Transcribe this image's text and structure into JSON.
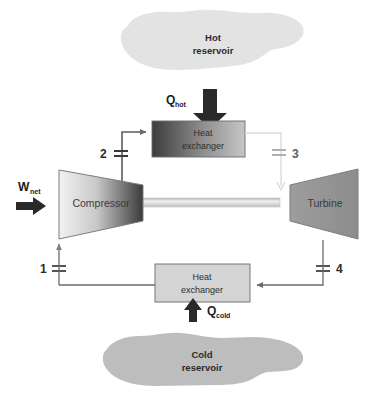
{
  "figure": {
    "background_color": "#ffffff"
  },
  "reservoirs": {
    "hot": {
      "line1": "Hot",
      "line2": "reservoir",
      "fill": "#e3e3e3",
      "name": "hot-reservoir"
    },
    "cold": {
      "line1": "Cold",
      "line2": "reservoir",
      "fill": "#bdbdbd",
      "name": "cold-reservoir"
    }
  },
  "components": {
    "compressor": {
      "label": "Compressor",
      "gradient_from": "#ededed",
      "gradient_to": "#3c3c3c",
      "stroke": "#6e6e6e"
    },
    "turbine": {
      "label": "Turbine",
      "gradient_from": "#9a9a9a",
      "gradient_to": "#8a8a8a",
      "stroke": "#7a7a7a"
    },
    "heat_exchanger_hot": {
      "line1": "Heat",
      "line2": "exchanger",
      "gradient_from": "#3f3f3f",
      "gradient_to": "#c2c2c2",
      "stroke": "#6a6a6a"
    },
    "heat_exchanger_cold": {
      "line1": "Heat",
      "line2": "exchanger",
      "fill": "#d4d4d4",
      "stroke": "#6a6a6a"
    },
    "shaft": {
      "name": "drive-shaft",
      "fill": "#d8d8d8"
    }
  },
  "heat_flows": {
    "q_hot": {
      "symbol": "Q",
      "subscript": "hot",
      "direction": "up",
      "arrow_color": "#2a2a2a"
    },
    "q_cold": {
      "symbol": "Q",
      "subscript": "cold",
      "direction": "up",
      "arrow_color": "#2a2a2a"
    }
  },
  "work": {
    "w_net": {
      "symbol": "W",
      "subscript": "net",
      "direction": "right",
      "arrow_color": "#2a2a2a"
    }
  },
  "state_points": [
    {
      "id": "1",
      "label": "1",
      "x": 44,
      "y": 269,
      "faint": false
    },
    {
      "id": "2",
      "label": "2",
      "x": 106,
      "y": 153,
      "faint": false
    },
    {
      "id": "3",
      "label": "3",
      "x": 293,
      "y": 152,
      "faint": true
    },
    {
      "id": "4",
      "label": "4",
      "x": 336,
      "y": 269,
      "faint": false
    }
  ],
  "piping": {
    "line_color": "#6b6b6b",
    "line_color_faint": "#cfcfcf",
    "arrow_color": "#6b6b6b"
  },
  "caption": {
    "text": "",
    "visible": false
  }
}
